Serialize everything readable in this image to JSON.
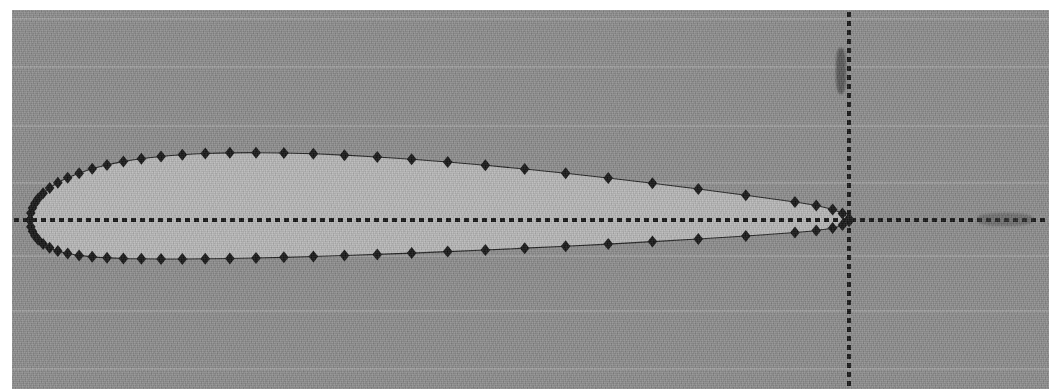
{
  "figure": {
    "title": "",
    "background_color": "#8b8b8b",
    "airfoil_fill_color": "#b6b6b6",
    "marker_color": "#111111",
    "axis_color": "#101010"
  },
  "chart_data": {
    "type": "scatter",
    "title": "",
    "subtitle": "",
    "xlabel": "",
    "ylabel": "",
    "xlim": [
      -0.03,
      1.18
    ],
    "ylim": [
      -0.29,
      0.29
    ],
    "grid": true,
    "legend": null,
    "annotations": [],
    "xticklabels": [],
    "yticklabels": [],
    "axes_style": "dotted-crosshair",
    "origin_px": {
      "x": 837,
      "y": 210
    },
    "chord_px": {
      "x_leading_edge": 18,
      "x_trailing_edge": 837
    },
    "marker_style": "filled-diamond",
    "marker_size_px": 12,
    "series": [
      {
        "name": "upper surface",
        "x": [
          0.0,
          0.001,
          0.003,
          0.006,
          0.01,
          0.016,
          0.024,
          0.034,
          0.046,
          0.06,
          0.076,
          0.094,
          0.114,
          0.136,
          0.16,
          0.186,
          0.214,
          0.244,
          0.276,
          0.31,
          0.346,
          0.384,
          0.424,
          0.466,
          0.51,
          0.556,
          0.604,
          0.654,
          0.706,
          0.76,
          0.816,
          0.874,
          0.934,
          0.96,
          0.98,
          0.992,
          1.0
        ],
        "y": [
          0.0,
          0.0085,
          0.0145,
          0.0205,
          0.0262,
          0.0328,
          0.0392,
          0.0455,
          0.0515,
          0.0572,
          0.0625,
          0.0672,
          0.0713,
          0.0748,
          0.0776,
          0.0797,
          0.0812,
          0.082,
          0.0822,
          0.0818,
          0.0808,
          0.0792,
          0.077,
          0.0742,
          0.0708,
          0.0668,
          0.0622,
          0.057,
          0.0512,
          0.0448,
          0.0378,
          0.0302,
          0.022,
          0.0178,
          0.0128,
          0.0078,
          0.0015
        ]
      },
      {
        "name": "lower surface",
        "x": [
          0.0,
          0.001,
          0.003,
          0.006,
          0.01,
          0.016,
          0.024,
          0.034,
          0.046,
          0.06,
          0.076,
          0.094,
          0.114,
          0.136,
          0.16,
          0.186,
          0.214,
          0.244,
          0.276,
          0.31,
          0.346,
          0.384,
          0.424,
          0.466,
          0.51,
          0.556,
          0.604,
          0.654,
          0.706,
          0.76,
          0.816,
          0.874,
          0.934,
          0.96,
          0.98,
          0.992,
          1.0
        ],
        "y": [
          0.0,
          -0.0082,
          -0.0138,
          -0.0192,
          -0.024,
          -0.0292,
          -0.0338,
          -0.0378,
          -0.0408,
          -0.0432,
          -0.045,
          -0.0462,
          -0.047,
          -0.0474,
          -0.0476,
          -0.0476,
          -0.0474,
          -0.047,
          -0.0464,
          -0.0456,
          -0.0446,
          -0.0434,
          -0.042,
          -0.0404,
          -0.0386,
          -0.0366,
          -0.0344,
          -0.032,
          -0.0294,
          -0.0264,
          -0.0232,
          -0.0196,
          -0.0152,
          -0.0128,
          -0.0098,
          -0.0062,
          -0.0015
        ]
      }
    ]
  },
  "artifacts": {
    "vertical_axis_smudge": "scan-blot",
    "horizontal_axis_smudge": "scan-blot"
  }
}
